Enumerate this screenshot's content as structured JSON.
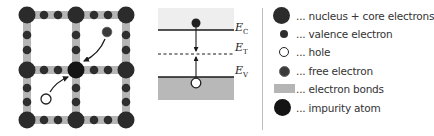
{
  "colors": {
    "nucleus": "#2b2b2b",
    "valence": "#2e2e2e",
    "bond": "#b5b5b5",
    "impurity": "#141414",
    "hole_fill": "#ffffff",
    "hole_stroke": "#222222",
    "conduction_band": "#eeeeee",
    "valence_band": "#b8b8b8",
    "divider": "#bdbdbd"
  },
  "lattice": {
    "grid_x": [
      27,
      76,
      126
    ],
    "grid_y": [
      15,
      70,
      120
    ],
    "impurity_position": [
      76,
      70
    ],
    "free_electron": [
      107,
      33
    ],
    "hole": [
      46,
      99
    ]
  },
  "band_diagram": {
    "labels": {
      "ec": {
        "main": "E",
        "sub": "C"
      },
      "et": {
        "main": "E",
        "sub": "T"
      },
      "ev": {
        "main": "E",
        "sub": "V"
      }
    }
  },
  "legend": {
    "items": [
      {
        "icon": "nucleus-icon",
        "label": "... nucleus + core electrons"
      },
      {
        "icon": "valence-electron-icon",
        "label": "... valence electron"
      },
      {
        "icon": "hole-icon",
        "label": "... hole"
      },
      {
        "icon": "free-electron-icon",
        "label": "... free electron"
      },
      {
        "icon": "electron-bonds-icon",
        "label": "... electron bonds"
      },
      {
        "icon": "impurity-atom-icon",
        "label": "... impurity atom"
      }
    ]
  }
}
